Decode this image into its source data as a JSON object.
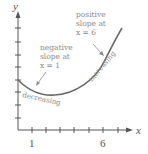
{
  "diagram": {
    "axes": {
      "x_label": "x",
      "y_label": "y",
      "x_ticks_labeled": [
        {
          "value": "1",
          "px": 32
        },
        {
          "value": "6",
          "px": 103
        }
      ],
      "x_tick_positions": [
        32,
        46,
        60,
        74,
        89,
        103,
        118
      ],
      "y_tick_positions": [
        28,
        42,
        55,
        67,
        80,
        92,
        105,
        118
      ]
    },
    "annotations": {
      "negative": {
        "line1": "negative",
        "line2": "slope at",
        "line3": "x = 1"
      },
      "positive": {
        "line1": "positive",
        "line2": "slope at",
        "line3": "x = 6"
      },
      "decreasing": "decreasing",
      "increasing": "increasing"
    },
    "colors": {
      "curve": "#6b6b6b",
      "axis": "#555555",
      "text": "#8a8a8a"
    }
  }
}
